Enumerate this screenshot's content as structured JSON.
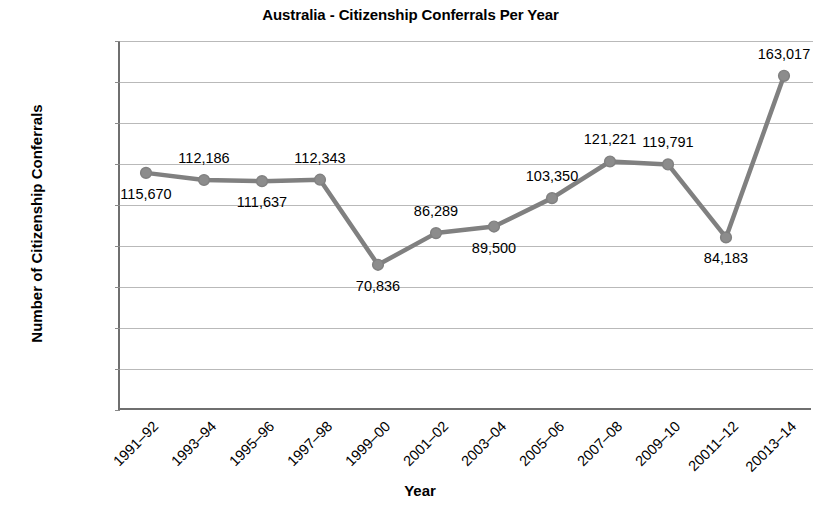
{
  "chart_data": {
    "type": "line",
    "title": "Australia - Citizenship Conferrals Per Year",
    "xlabel": "Year",
    "ylabel": "Number of Citizenship Conferrals",
    "categories": [
      "1991–92",
      "1993–94",
      "1995–96",
      "1997–98",
      "1999–00",
      "2001–02",
      "2003–04",
      "2005–06",
      "2007–08",
      "2009–10",
      "20011–12",
      "20013–14"
    ],
    "values": [
      115670,
      112186,
      111637,
      112343,
      70836,
      86289,
      89500,
      103350,
      121221,
      119791,
      84183,
      163017
    ],
    "point_labels": [
      "115,670",
      "112,186",
      "111,637",
      "112,343",
      "70,836",
      "86,289",
      "89,500",
      "103,350",
      "121,221",
      "119,791",
      "84,183",
      "163,017"
    ],
    "label_positions": [
      "below",
      "above",
      "below",
      "above",
      "below",
      "above",
      "below",
      "above",
      "above",
      "above",
      "below",
      "above"
    ],
    "ylim": [
      0,
      180000
    ],
    "ytick_labels": [
      "180,000",
      "160,000",
      "140,000",
      "120,000",
      "100,000",
      "80,000",
      "60,000",
      "40,000",
      "20,000",
      "0"
    ],
    "ytick_values": [
      180000,
      160000,
      140000,
      120000,
      100000,
      80000,
      60000,
      40000,
      20000,
      0
    ],
    "grid": true,
    "legend": "none",
    "series_color": "#808080",
    "marker_color": "#8c8c8c",
    "gridline_color": "#b9b9b9",
    "axis_color": "#6f6f6f",
    "background_color": "#ffffff"
  }
}
